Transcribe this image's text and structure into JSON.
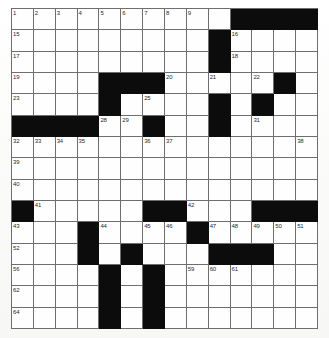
{
  "puzzle": {
    "title": "Crossword Grid",
    "rows": 15,
    "cols": 14,
    "colors": {
      "block": "#0c0c0c",
      "cell": "#fefefe",
      "rule": "#6e6e6e",
      "number": "#2a2a2a",
      "paper": "#fdfdfc"
    },
    "legend": {
      "black_symbol": "#",
      "white_symbol": "."
    },
    "grid_pattern": [
      "..........####",
      ".........#....",
      ".........#....",
      "....###.....#.",
      "....#....#.#..",
      "####..#..#....",
      "..............",
      "..............",
      "..............",
      "#.....##...###",
      "...#....#.....",
      "...#.#...###..",
      "....#.#.......",
      "....#.#.......",
      "....#.#......."
    ],
    "numbers": [
      {
        "n": 1,
        "row": 1,
        "col": 1
      },
      {
        "n": 2,
        "row": 1,
        "col": 2
      },
      {
        "n": 3,
        "row": 1,
        "col": 3
      },
      {
        "n": 4,
        "row": 1,
        "col": 4
      },
      {
        "n": 5,
        "row": 1,
        "col": 5
      },
      {
        "n": 6,
        "row": 1,
        "col": 6
      },
      {
        "n": 7,
        "row": 1,
        "col": 7
      },
      {
        "n": 8,
        "row": 1,
        "col": 8
      },
      {
        "n": 9,
        "row": 1,
        "col": 9
      },
      {
        "n": 10,
        "row": 1,
        "col": 11
      },
      {
        "n": 11,
        "row": 1,
        "col": 12
      },
      {
        "n": 12,
        "row": 1,
        "col": 13
      },
      {
        "n": 13,
        "row": 1,
        "col": 14
      },
      {
        "n": 14,
        "row": 1,
        "col": 14
      },
      {
        "n": 15,
        "row": 2,
        "col": 1
      },
      {
        "n": 16,
        "row": 2,
        "col": 11
      },
      {
        "n": 17,
        "row": 3,
        "col": 1
      },
      {
        "n": 18,
        "row": 3,
        "col": 11
      },
      {
        "n": 19,
        "row": 4,
        "col": 1
      },
      {
        "n": 20,
        "row": 4,
        "col": 8
      },
      {
        "n": 21,
        "row": 4,
        "col": 10
      },
      {
        "n": 22,
        "row": 4,
        "col": 12
      },
      {
        "n": 23,
        "row": 5,
        "col": 1
      },
      {
        "n": 24,
        "row": 5,
        "col": 5
      },
      {
        "n": 25,
        "row": 5,
        "col": 7
      },
      {
        "n": 26,
        "row": 5,
        "col": 10
      },
      {
        "n": 27,
        "row": 5,
        "col": 12
      },
      {
        "n": 28,
        "row": 6,
        "col": 5
      },
      {
        "n": 29,
        "row": 6,
        "col": 6
      },
      {
        "n": 30,
        "row": 6,
        "col": 10
      },
      {
        "n": 31,
        "row": 6,
        "col": 12
      },
      {
        "n": 32,
        "row": 7,
        "col": 1
      },
      {
        "n": 33,
        "row": 7,
        "col": 2
      },
      {
        "n": 34,
        "row": 7,
        "col": 3
      },
      {
        "n": 35,
        "row": 7,
        "col": 4
      },
      {
        "n": 36,
        "row": 7,
        "col": 7
      },
      {
        "n": 37,
        "row": 7,
        "col": 8
      },
      {
        "n": 38,
        "row": 7,
        "col": 14
      },
      {
        "n": 39,
        "row": 8,
        "col": 1
      },
      {
        "n": 40,
        "row": 9,
        "col": 1
      },
      {
        "n": 41,
        "row": 10,
        "col": 2
      },
      {
        "n": 42,
        "row": 10,
        "col": 9
      },
      {
        "n": 43,
        "row": 11,
        "col": 1
      },
      {
        "n": 44,
        "row": 11,
        "col": 5
      },
      {
        "n": 45,
        "row": 11,
        "col": 7
      },
      {
        "n": 46,
        "row": 11,
        "col": 8
      },
      {
        "n": 47,
        "row": 11,
        "col": 10
      },
      {
        "n": 48,
        "row": 11,
        "col": 11
      },
      {
        "n": 49,
        "row": 11,
        "col": 12
      },
      {
        "n": 50,
        "row": 11,
        "col": 13
      },
      {
        "n": 51,
        "row": 11,
        "col": 14
      },
      {
        "n": 52,
        "row": 12,
        "col": 1
      },
      {
        "n": 53,
        "row": 12,
        "col": 4
      },
      {
        "n": 54,
        "row": 12,
        "col": 6
      },
      {
        "n": 55,
        "row": 12,
        "col": 11
      },
      {
        "n": 56,
        "row": 13,
        "col": 1
      },
      {
        "n": 57,
        "row": 13,
        "col": 5
      },
      {
        "n": 58,
        "row": 13,
        "col": 7
      },
      {
        "n": 59,
        "row": 13,
        "col": 9
      },
      {
        "n": 60,
        "row": 13,
        "col": 10
      },
      {
        "n": 61,
        "row": 13,
        "col": 11
      },
      {
        "n": 62,
        "row": 14,
        "col": 1
      },
      {
        "n": 63,
        "row": 14,
        "col": 7
      },
      {
        "n": 64,
        "row": 15,
        "col": 1
      },
      {
        "n": 65,
        "row": 15,
        "col": 7
      }
    ],
    "letters": []
  }
}
